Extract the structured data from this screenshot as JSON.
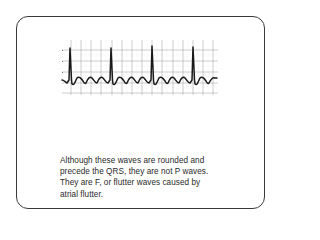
{
  "figure": {
    "caption_lines": [
      "Although these waves are rounded and",
      "precede the QRS, they are not P waves.",
      "They are F, or flutter waves caused by",
      "atrial flutter."
    ],
    "ecg_strip": {
      "rhythm": "atrial flutter",
      "qrs_complex_count": 4,
      "flutter_wave_shape": "rounded",
      "grid_color": "#9a9a9a",
      "trace_color": "#1a1a1a"
    }
  }
}
